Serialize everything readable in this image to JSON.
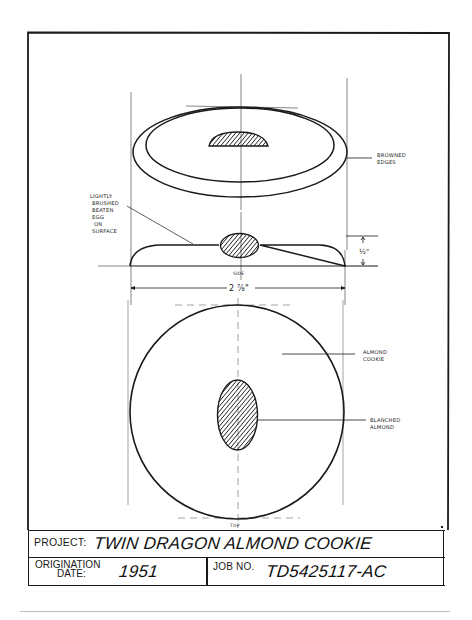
{
  "drawing": {
    "title": "Twin Dragon Almond Cookie technical drawing",
    "views": {
      "perspective": {
        "callouts": [
          "BROWNED EDGES"
        ]
      },
      "side": {
        "label": "SIDE",
        "callouts": [
          "LIGHTLY BRUSHED BEATEN EGG ON SURFACE"
        ],
        "callout_lines": [
          "LIGHTLY",
          "BRUSHED",
          "BEATEN",
          "EGG",
          "ON",
          "SURFACE"
        ],
        "height_dimension": "1/2\"",
        "width_dimension": "2 7/8\""
      },
      "top": {
        "label": "TOP",
        "callouts": [
          "ALMOND COOKIE",
          "BLANCHED ALMOND"
        ]
      }
    },
    "callout_labels": {
      "browned_1": "BROWNED",
      "browned_2": "EDGES",
      "cookie_1": "ALMOND",
      "cookie_2": "COOKIE",
      "almond_1": "BLANCHED",
      "almond_2": "ALMOND",
      "egg_1": "LIGHTLY",
      "egg_2": "BRUSHED",
      "egg_3": "BEATEN",
      "egg_4": "EGG",
      "egg_5": "ON",
      "egg_6": "SURFACE",
      "side": "SIDE",
      "top": "TOP",
      "dim_height": "½\"",
      "dim_width": "2 ⅞\""
    },
    "colors": {
      "ink": "#1a1a1a",
      "paper": "#ffffff",
      "rule": "#bdbdbd"
    }
  },
  "title_block": {
    "project_label": "PROJECT:",
    "project_value": "TWIN DRAGON ALMOND COOKIE",
    "origination_label_1": "ORIGINATION",
    "origination_label_2": "DATE:",
    "origination_value": "1951",
    "job_label": "JOB NO.",
    "job_value": "TD5425117-AC"
  }
}
